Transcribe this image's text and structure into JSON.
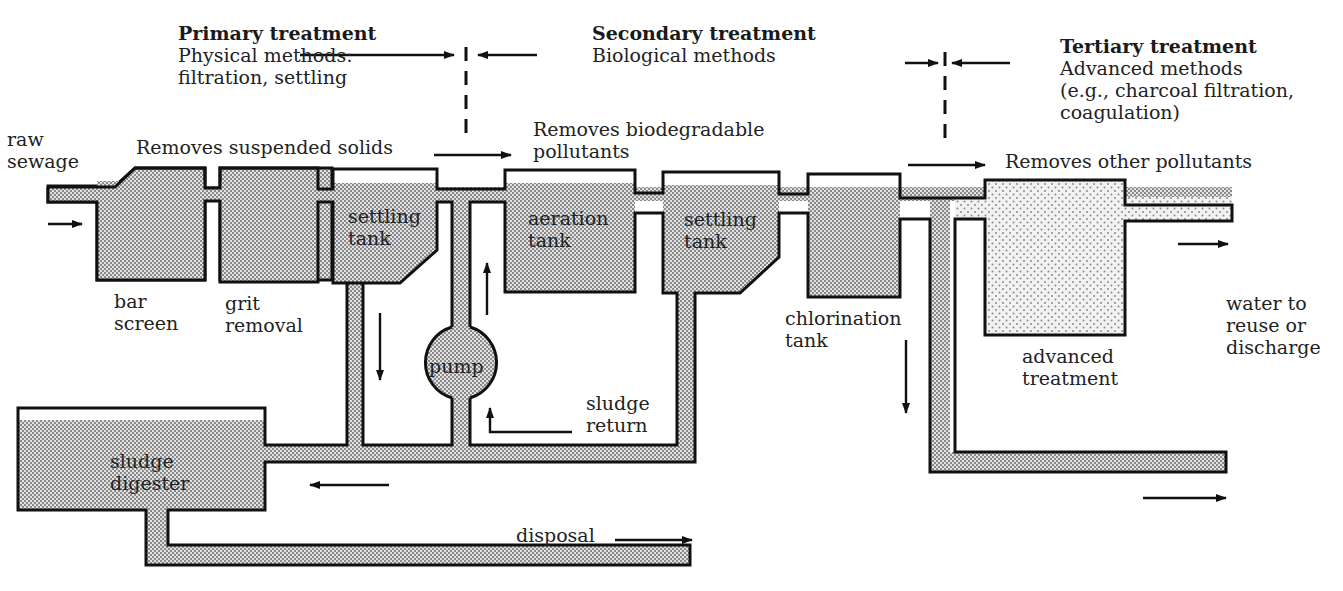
{
  "stages": [
    {
      "id": "primary",
      "title": "Primary treatment",
      "lines": [
        "Physical methods:",
        "filtration, settling"
      ],
      "removes": "Removes suspended solids"
    },
    {
      "id": "secondary",
      "title": "Secondary treatment",
      "lines": [
        "Biological methods"
      ],
      "removes_lines": [
        "Removes biodegradable",
        "pollutants"
      ]
    },
    {
      "id": "tertiary",
      "title": "Tertiary treatment",
      "lines": [
        "Advanced methods",
        "(e.g., charcoal filtration,",
        "coagulation)"
      ],
      "removes": "Removes other pollutants"
    }
  ],
  "labels": {
    "inlet": [
      "raw",
      "sewage"
    ],
    "bar_screen": [
      "bar",
      "screen"
    ],
    "grit_removal": [
      "grit",
      "removal"
    ],
    "primary_settling": [
      "settling",
      "tank"
    ],
    "pump": "pump",
    "aeration": [
      "aeration",
      "tank"
    ],
    "secondary_settling": [
      "settling",
      "tank"
    ],
    "sludge_return": [
      "sludge",
      "return"
    ],
    "chlorination": [
      "chlorination",
      "tank"
    ],
    "advanced": [
      "advanced",
      "treatment"
    ],
    "outlet": [
      "water to",
      "reuse or",
      "discharge"
    ],
    "digester": [
      "sludge",
      "digester"
    ],
    "disposal": "disposal"
  },
  "colors": {
    "line": "#111111",
    "fill_dark": "#b8b8b8",
    "fill_light": "#d4d4d4",
    "background": "#ffffff"
  }
}
